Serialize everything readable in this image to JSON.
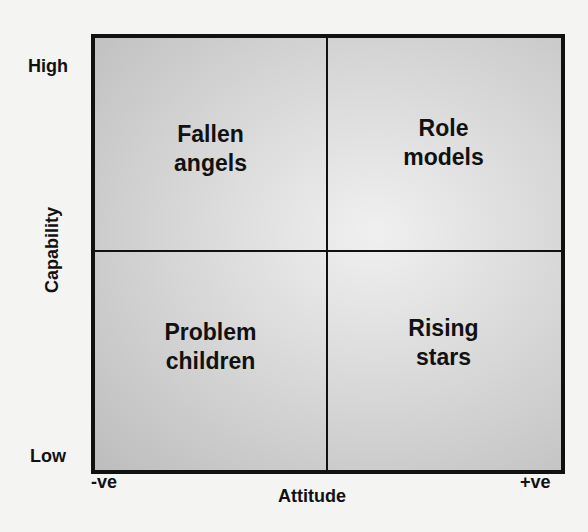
{
  "diagram": {
    "type": "2x2 matrix",
    "y_axis": {
      "label": "Capability",
      "high": "High",
      "low": "Low"
    },
    "x_axis": {
      "label": "Attitude",
      "low": "-ve",
      "high": "+ve"
    },
    "quadrants": {
      "top_left": {
        "line1": "Fallen",
        "line2": "angels"
      },
      "top_right": {
        "line1": "Role",
        "line2": "models"
      },
      "bottom_left": {
        "line1": "Problem",
        "line2": "children"
      },
      "bottom_right": {
        "line1": "Rising",
        "line2": "stars"
      }
    }
  }
}
